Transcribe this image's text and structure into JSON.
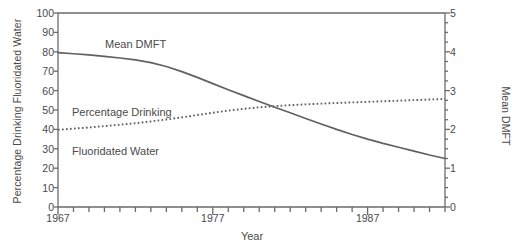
{
  "chart_data": {
    "type": "line",
    "title": "",
    "xlabel": "Year",
    "ylabel": "Percentage Drinking Fluoridated Water",
    "ylabel_right": "Mean DMFT",
    "xlim": [
      1967,
      1992
    ],
    "ylim": [
      0,
      100
    ],
    "ylim_right": [
      0,
      5
    ],
    "grid": false,
    "legend": "inline-annotations",
    "x_ticks_labeled": [
      "1967",
      "1977",
      "1987"
    ],
    "x_ticks_labeled_values": [
      1967,
      1977,
      1987
    ],
    "x_tick_step": 1,
    "y_ticks_left": [
      "0",
      "10",
      "20",
      "30",
      "40",
      "50",
      "60",
      "70",
      "80",
      "90",
      "100"
    ],
    "y_ticks_left_values": [
      0,
      10,
      20,
      30,
      40,
      50,
      60,
      70,
      80,
      90,
      100
    ],
    "y_ticks_right": [
      "0",
      "1",
      "2",
      "3",
      "4",
      "5"
    ],
    "y_ticks_right_values": [
      0,
      1,
      2,
      3,
      4,
      5
    ],
    "x": [
      1967,
      1968,
      1969,
      1970,
      1971,
      1972,
      1973,
      1974,
      1975,
      1976,
      1977,
      1978,
      1979,
      1980,
      1981,
      1982,
      1983,
      1984,
      1985,
      1986,
      1987,
      1988,
      1989,
      1990,
      1991,
      1992
    ],
    "series": [
      {
        "name": "Mean DMFT",
        "axis": "right",
        "style": "solid",
        "color": "#616161",
        "values": [
          3.98,
          3.95,
          3.92,
          3.88,
          3.84,
          3.79,
          3.72,
          3.62,
          3.49,
          3.34,
          3.18,
          3.02,
          2.87,
          2.72,
          2.57,
          2.43,
          2.28,
          2.14,
          2.0,
          1.87,
          1.75,
          1.64,
          1.54,
          1.44,
          1.34,
          1.25
        ]
      },
      {
        "name": "Percentage Drinking Fluoridated Water",
        "axis": "left",
        "style": "dotted",
        "color": "#616161",
        "values": [
          39.8,
          40.4,
          41.0,
          41.7,
          42.4,
          43.2,
          44.1,
          45.1,
          46.2,
          47.4,
          48.6,
          49.7,
          50.6,
          51.4,
          52.0,
          52.5,
          52.9,
          53.3,
          53.6,
          53.9,
          54.2,
          54.5,
          54.8,
          55.1,
          55.4,
          55.7
        ]
      }
    ],
    "annotations": [
      {
        "text": "Mean DMFT",
        "x": 1970.5,
        "y_right": 4.35
      },
      {
        "text": "Percentage Drinking",
        "x": 1968.2,
        "y_left": 61
      },
      {
        "text": "Fluoridated Water",
        "x": 1968.2,
        "y_left": 55
      }
    ],
    "axis_color": "#6a6a6a",
    "text_color": "#4a4a4a",
    "background": "#ffffff"
  },
  "labels": {
    "y_left_title": "Percentage Drinking Fluoridated Water",
    "y_right_title": "Mean DMFT",
    "x_title": "Year",
    "annot_dmft": "Mean DMFT",
    "annot_fluor_line1": "Percentage Drinking",
    "annot_fluor_line2": "Fluoridated Water"
  }
}
